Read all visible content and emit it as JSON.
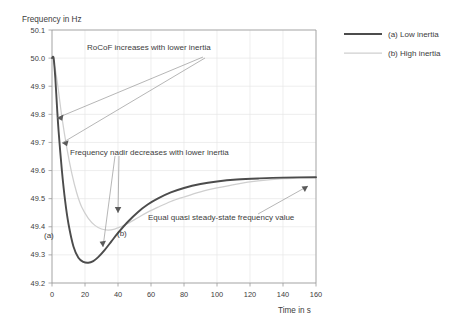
{
  "chart_data": {
    "type": "line",
    "title": "",
    "xlabel": "Time in s",
    "ylabel": "Frequency in Hz",
    "xlim": [
      0,
      160
    ],
    "ylim": [
      49.2,
      50.1
    ],
    "xticks": [
      0,
      20,
      40,
      60,
      80,
      100,
      120,
      140,
      160
    ],
    "yticks": [
      49.2,
      49.3,
      49.4,
      49.5,
      49.6,
      49.7,
      49.8,
      49.9,
      50.0,
      50.1
    ],
    "grid": true,
    "legend_position": "right",
    "series": [
      {
        "name": "(a) Low inertia",
        "color": "#4c4c4c",
        "x": [
          0,
          1,
          2,
          3,
          4,
          6,
          8,
          10,
          13,
          16,
          19,
          22,
          25,
          28,
          32,
          36,
          40,
          46,
          52,
          58,
          64,
          72,
          80,
          90,
          100,
          112,
          125,
          140,
          160
        ],
        "y": [
          50.0,
          50.0,
          49.93,
          49.83,
          49.74,
          49.6,
          49.49,
          49.41,
          49.33,
          49.29,
          49.275,
          49.272,
          49.278,
          49.292,
          49.318,
          49.348,
          49.378,
          49.418,
          49.452,
          49.479,
          49.5,
          49.522,
          49.538,
          49.552,
          49.561,
          49.568,
          49.572,
          49.575,
          49.576
        ]
      },
      {
        "name": "(b) High inertia",
        "color": "#cfcfcf",
        "x": [
          0,
          2,
          4,
          6,
          9,
          12,
          15,
          18,
          22,
          26,
          30,
          34,
          38,
          42,
          46,
          52,
          58,
          64,
          72,
          80,
          90,
          100,
          112,
          125,
          140,
          160
        ],
        "y": [
          50.0,
          49.96,
          49.88,
          49.79,
          49.68,
          49.59,
          49.52,
          49.47,
          49.43,
          49.405,
          49.392,
          49.388,
          49.392,
          49.401,
          49.412,
          49.432,
          49.452,
          49.469,
          49.49,
          49.506,
          49.524,
          49.538,
          49.552,
          49.563,
          49.571,
          49.576
        ]
      }
    ],
    "annotations": [
      {
        "text": "RoCoF increases with lower inertia"
      },
      {
        "text": "Frequency nadir decreases with lower inertia"
      },
      {
        "text": "Equal quasi steady-state frequency value"
      }
    ],
    "inline_labels": [
      {
        "text": "(a)"
      },
      {
        "text": "(b)"
      }
    ]
  },
  "axes": {
    "y_title": "Frequency in Hz",
    "x_title": "Time in s",
    "y_tick_labels": [
      "50.1",
      "50.0",
      "49.9",
      "49.8",
      "49.7",
      "49.6",
      "49.5",
      "49.4",
      "49.3",
      "49.2"
    ],
    "x_tick_labels": [
      "0",
      "20",
      "40",
      "60",
      "80",
      "100",
      "120",
      "140",
      "160"
    ]
  },
  "annotations": {
    "rocof": "RoCoF increases with lower inertia",
    "nadir": "Frequency nadir decreases with lower inertia",
    "steady": "Equal quasi steady-state frequency value",
    "label_a": "(a)",
    "label_b": "(b)"
  },
  "legend": {
    "items": [
      {
        "label": "(a) Low inertia",
        "color": "#4c4c4c"
      },
      {
        "label": "(b) High inertia",
        "color": "#cfcfcf"
      }
    ]
  }
}
